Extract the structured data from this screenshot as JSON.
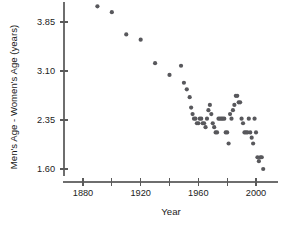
{
  "chart_data": {
    "type": "scatter",
    "title": "",
    "xlabel": "Year",
    "ylabel": "Men's Age - Women's Age (years)",
    "xlim": [
      1870,
      2015
    ],
    "ylim": [
      1.45,
      4.25
    ],
    "grid": false,
    "legend": null,
    "marker": {
      "shape": "circle",
      "color": "#58585c",
      "size": 2.1
    },
    "x_ticks": [
      {
        "value": 1880,
        "label": "1880",
        "major": true
      },
      {
        "value": 1900,
        "label": "",
        "major": false
      },
      {
        "value": 1920,
        "label": "1920",
        "major": true
      },
      {
        "value": 1940,
        "label": "",
        "major": false
      },
      {
        "value": 1960,
        "label": "1960",
        "major": true
      },
      {
        "value": 1980,
        "label": "",
        "major": false
      },
      {
        "value": 2000,
        "label": "2000",
        "major": true
      }
    ],
    "y_ticks": [
      {
        "value": 1.6,
        "label": "1.60"
      },
      {
        "value": 2.35,
        "label": "2.35"
      },
      {
        "value": 3.1,
        "label": "3.10"
      },
      {
        "value": 3.85,
        "label": "3.85"
      }
    ],
    "points": [
      {
        "x": 1890,
        "y": 4.09
      },
      {
        "x": 1900,
        "y": 4.0
      },
      {
        "x": 1910,
        "y": 3.66
      },
      {
        "x": 1920,
        "y": 3.58
      },
      {
        "x": 1930,
        "y": 3.22
      },
      {
        "x": 1940,
        "y": 3.04
      },
      {
        "x": 1948,
        "y": 3.18
      },
      {
        "x": 1950,
        "y": 2.92
      },
      {
        "x": 1952,
        "y": 2.82
      },
      {
        "x": 1954,
        "y": 2.7
      },
      {
        "x": 1955,
        "y": 2.54
      },
      {
        "x": 1956,
        "y": 2.44
      },
      {
        "x": 1957,
        "y": 2.37
      },
      {
        "x": 1958,
        "y": 2.37
      },
      {
        "x": 1959,
        "y": 2.3
      },
      {
        "x": 1960,
        "y": 2.3
      },
      {
        "x": 1961,
        "y": 2.37
      },
      {
        "x": 1962,
        "y": 2.37
      },
      {
        "x": 1963,
        "y": 2.3
      },
      {
        "x": 1964,
        "y": 2.3
      },
      {
        "x": 1965,
        "y": 2.24
      },
      {
        "x": 1966,
        "y": 2.37
      },
      {
        "x": 1967,
        "y": 2.5
      },
      {
        "x": 1968,
        "y": 2.58
      },
      {
        "x": 1969,
        "y": 2.44
      },
      {
        "x": 1970,
        "y": 2.3
      },
      {
        "x": 1971,
        "y": 2.24
      },
      {
        "x": 1972,
        "y": 2.16
      },
      {
        "x": 1973,
        "y": 2.16
      },
      {
        "x": 1974,
        "y": 2.37
      },
      {
        "x": 1975,
        "y": 2.37
      },
      {
        "x": 1976,
        "y": 2.37
      },
      {
        "x": 1977,
        "y": 2.37
      },
      {
        "x": 1978,
        "y": 2.37
      },
      {
        "x": 1979,
        "y": 2.16
      },
      {
        "x": 1980,
        "y": 2.16
      },
      {
        "x": 1981,
        "y": 1.99
      },
      {
        "x": 1982,
        "y": 2.44
      },
      {
        "x": 1983,
        "y": 2.37
      },
      {
        "x": 1984,
        "y": 2.5
      },
      {
        "x": 1985,
        "y": 2.58
      },
      {
        "x": 1986,
        "y": 2.72
      },
      {
        "x": 1987,
        "y": 2.72
      },
      {
        "x": 1988,
        "y": 2.62
      },
      {
        "x": 1989,
        "y": 2.62
      },
      {
        "x": 1990,
        "y": 2.37
      },
      {
        "x": 1991,
        "y": 2.3
      },
      {
        "x": 1992,
        "y": 2.16
      },
      {
        "x": 1993,
        "y": 2.16
      },
      {
        "x": 1994,
        "y": 2.16
      },
      {
        "x": 1995,
        "y": 2.37
      },
      {
        "x": 1996,
        "y": 2.16
      },
      {
        "x": 1997,
        "y": 2.08
      },
      {
        "x": 1998,
        "y": 1.99
      },
      {
        "x": 1999,
        "y": 2.37
      },
      {
        "x": 2000,
        "y": 2.16
      },
      {
        "x": 2001,
        "y": 1.78
      },
      {
        "x": 2002,
        "y": 1.72
      },
      {
        "x": 2003,
        "y": 1.78
      },
      {
        "x": 2004,
        "y": 1.78
      },
      {
        "x": 2005,
        "y": 1.6
      },
      {
        "x": 1944,
        "y": 4.24
      },
      {
        "x": 1990,
        "y": 4.24
      }
    ]
  }
}
